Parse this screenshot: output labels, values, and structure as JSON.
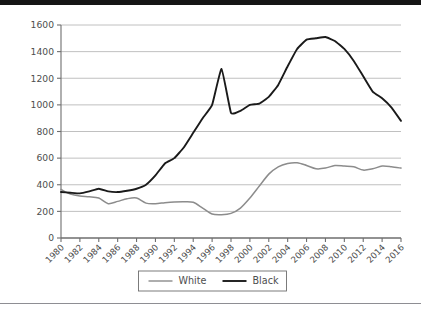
{
  "chart_data": {
    "type": "line",
    "title": "",
    "xlabel": "",
    "ylabel": "",
    "x": [
      1980,
      1981,
      1982,
      1983,
      1984,
      1985,
      1986,
      1987,
      1988,
      1989,
      1990,
      1991,
      1992,
      1993,
      1994,
      1995,
      1996,
      1997,
      1998,
      1999,
      2000,
      2001,
      2002,
      2003,
      2004,
      2005,
      2006,
      2007,
      2008,
      2009,
      2010,
      2011,
      2012,
      2013,
      2014,
      2015,
      2016
    ],
    "xlim": [
      1980,
      2016
    ],
    "ylim": [
      0,
      1600
    ],
    "yticks": [
      0,
      200,
      400,
      600,
      800,
      1000,
      1200,
      1400,
      1600
    ],
    "xticks": [
      1980,
      1982,
      1984,
      1986,
      1988,
      1990,
      1992,
      1994,
      1996,
      1998,
      2000,
      2002,
      2004,
      2006,
      2008,
      2010,
      2012,
      2014,
      2016
    ],
    "xtick_labels": [
      "1980",
      "1982",
      "1984",
      "1986",
      "1988",
      "1990",
      "1992",
      "1994",
      "1996",
      "1998",
      "2000",
      "2002",
      "2004",
      "2006",
      "2008",
      "2010",
      "2012",
      "2014",
      "2016"
    ],
    "ytick_labels": [
      "0",
      "200",
      "400",
      "600",
      "800",
      "1000",
      "1200",
      "1400",
      "1600"
    ],
    "grid": true,
    "grid_axis": "y",
    "legend_position": "bottom",
    "series": [
      {
        "name": "White",
        "color": "#8c8c8c",
        "values": [
          365,
          330,
          315,
          310,
          300,
          258,
          275,
          295,
          300,
          262,
          258,
          265,
          270,
          272,
          268,
          225,
          180,
          175,
          185,
          225,
          300,
          390,
          480,
          535,
          560,
          565,
          545,
          520,
          525,
          545,
          540,
          535,
          510,
          520,
          540,
          535,
          525
        ]
      },
      {
        "name": "Black",
        "color": "#1a1a1a",
        "values": [
          345,
          340,
          335,
          350,
          370,
          350,
          345,
          355,
          370,
          400,
          470,
          560,
          600,
          680,
          790,
          900,
          1000,
          1270,
          940,
          955,
          1000,
          1010,
          1060,
          1150,
          1290,
          1420,
          1490,
          1500,
          1510,
          1480,
          1420,
          1330,
          1215,
          1100,
          1050,
          980,
          880
        ]
      }
    ],
    "series_note": "two-series annual line chart 1980-2016"
  },
  "chart_series_detail": {
    "white": {
      "label": "White",
      "points": [
        {
          "year": 1980,
          "value": 365
        },
        {
          "year": 1981,
          "value": 330
        },
        {
          "year": 1982,
          "value": 315
        },
        {
          "year": 1983,
          "value": 312
        },
        {
          "year": 1984,
          "value": 300
        },
        {
          "year": 1985,
          "value": 258
        },
        {
          "year": 1986,
          "value": 272
        },
        {
          "year": 1987,
          "value": 298
        },
        {
          "year": 1988,
          "value": 300
        },
        {
          "year": 1989,
          "value": 262
        },
        {
          "year": 1990,
          "value": 258
        },
        {
          "year": 1991,
          "value": 268
        },
        {
          "year": 1992,
          "value": 272
        },
        {
          "year": 1993,
          "value": 272
        },
        {
          "year": 1994,
          "value": 262
        },
        {
          "year": 1995,
          "value": 215
        },
        {
          "year": 1996,
          "value": 182
        },
        {
          "year": 1997,
          "value": 175
        },
        {
          "year": 1998,
          "value": 188
        },
        {
          "year": 1999,
          "value": 232
        },
        {
          "year": 2000,
          "value": 310
        },
        {
          "year": 2001,
          "value": 400
        },
        {
          "year": 2002,
          "value": 490
        },
        {
          "year": 2003,
          "value": 545
        },
        {
          "year": 2004,
          "value": 565
        },
        {
          "year": 2005,
          "value": 558
        },
        {
          "year": 2006,
          "value": 528
        },
        {
          "year": 2007,
          "value": 515
        },
        {
          "year": 2008,
          "value": 535
        },
        {
          "year": 2009,
          "value": 545
        },
        {
          "year": 2010,
          "value": 530
        },
        {
          "year": 2011,
          "value": 512
        },
        {
          "year": 2012,
          "value": 520
        },
        {
          "year": 2013,
          "value": 540
        },
        {
          "year": 2014,
          "value": 528
        },
        {
          "year": 2015,
          "value": 520
        },
        {
          "year": 2016,
          "value": 520
        }
      ]
    },
    "black": {
      "label": "Black",
      "points": [
        {
          "year": 1980,
          "value": 345
        },
        {
          "year": 1981,
          "value": 338
        },
        {
          "year": 1982,
          "value": 332
        },
        {
          "year": 1983,
          "value": 352
        },
        {
          "year": 1984,
          "value": 372
        },
        {
          "year": 1985,
          "value": 350
        },
        {
          "year": 1986,
          "value": 348
        },
        {
          "year": 1987,
          "value": 358
        },
        {
          "year": 1988,
          "value": 375
        },
        {
          "year": 1989,
          "value": 405
        },
        {
          "year": 1990,
          "value": 475
        },
        {
          "year": 1991,
          "value": 560
        },
        {
          "year": 1992,
          "value": 605
        },
        {
          "year": 1993,
          "value": 685
        },
        {
          "year": 1994,
          "value": 795
        },
        {
          "year": 1995,
          "value": 905
        },
        {
          "year": 1996,
          "value": 1005
        },
        {
          "year": 1997,
          "value": 1270
        },
        {
          "year": 1998,
          "value": 940
        },
        {
          "year": 1999,
          "value": 955
        },
        {
          "year": 2000,
          "value": 1000
        },
        {
          "year": 2001,
          "value": 1015
        },
        {
          "year": 2002,
          "value": 1065
        },
        {
          "year": 2003,
          "value": 1155
        },
        {
          "year": 2004,
          "value": 1295
        },
        {
          "year": 2005,
          "value": 1425
        },
        {
          "year": 2006,
          "value": 1490
        },
        {
          "year": 2007,
          "value": 1505
        },
        {
          "year": 2008,
          "value": 1512
        },
        {
          "year": 2009,
          "value": 1480
        },
        {
          "year": 2010,
          "value": 1420
        },
        {
          "year": 2011,
          "value": 1330
        },
        {
          "year": 2012,
          "value": 1215
        },
        {
          "year": 2013,
          "value": 1100
        },
        {
          "year": 2014,
          "value": 1050
        },
        {
          "year": 2015,
          "value": 980
        },
        {
          "year": 2016,
          "value": 880
        }
      ]
    }
  },
  "legend": {
    "entries": [
      {
        "label": "White",
        "color": "#8c8c8c"
      },
      {
        "label": "Black",
        "color": "#1a1a1a"
      }
    ]
  },
  "axes": {
    "y_tick_labels": [
      "1600",
      "1400",
      "1200",
      "1000",
      "800",
      "600",
      "400",
      "200",
      "0"
    ],
    "x_tick_labels": [
      "1980",
      "1982",
      "1984",
      "1986",
      "1988",
      "1990",
      "1992",
      "1994",
      "1996",
      "1998",
      "2000",
      "2002",
      "2004",
      "2006",
      "2008",
      "2010",
      "2012",
      "2014",
      "2016"
    ]
  },
  "colors": {
    "white_series": "#8c8c8c",
    "black_series": "#1a1a1a",
    "grid": "#b9b9b9",
    "axis": "#6e6e6e",
    "text": "#4d4d4d",
    "top_band": "#151515",
    "bottom_rule": "#8e8e93"
  }
}
